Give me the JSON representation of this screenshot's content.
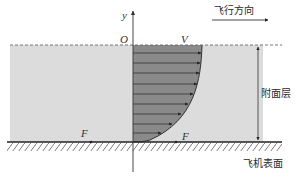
{
  "diagram": {
    "type": "boundary-layer velocity profile",
    "axis": {
      "label": "y",
      "origin_label": "O"
    },
    "labels": {
      "flight_direction": "飞行方向",
      "boundary_layer": "附面层",
      "aircraft_surface": "飞机表面",
      "freestream_velocity": "V",
      "force_left": "F",
      "force_right": "F"
    },
    "profile": {
      "arrow_count": 9,
      "description": "velocity increases from zero at surface to V at boundary layer edge"
    },
    "colors": {
      "boundary_layer_fill": "#dcdcdc",
      "profile_fill": "#8a8a8a",
      "line": "#333333"
    }
  }
}
